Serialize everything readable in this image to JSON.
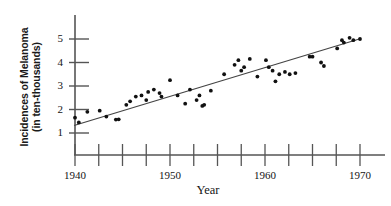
{
  "chart_data": {
    "type": "scatter",
    "title": "",
    "xlabel": "Year",
    "ylabel": "Incidences of Melanoma (in ten-thousands)",
    "ylabel_lines": [
      "Incidences of Melanoma",
      "(in ten-thousands)"
    ],
    "xlim": [
      1938.5,
      1971.5
    ],
    "ylim": [
      0.55,
      5.6
    ],
    "grid": false,
    "legend": null,
    "xtick_labels": [
      "1940",
      "1950",
      "1960",
      "1970"
    ],
    "xtick_values": [
      1940,
      1950,
      1960,
      1970
    ],
    "xminor_tick_values": [
      1940,
      1942.5,
      1945,
      1947.5,
      1950,
      1952.5,
      1955,
      1957.5,
      1960,
      1962.5,
      1965,
      1967.5,
      1970
    ],
    "ytick_labels": [
      "1",
      "2",
      "3",
      "4",
      "5"
    ],
    "ytick_values": [
      1,
      2,
      3,
      4,
      5
    ],
    "point_color": "#111111",
    "line_color": "#444444",
    "axis_color": "#555555",
    "background_color": "#ffffff",
    "series": [
      {
        "name": "Melanoma incidence",
        "x": [
          1940,
          1940.4,
          1941.3,
          1942.6,
          1943.3,
          1944.3,
          1944.6,
          1945.4,
          1945.8,
          1946.4,
          1947.0,
          1947.5,
          1947.7,
          1948.3,
          1948.9,
          1949.1,
          1950.0,
          1950.8,
          1951.6,
          1952.1,
          1952.8,
          1953.1,
          1953.4,
          1953.6,
          1954.3,
          1955.7,
          1956.8,
          1957.2,
          1957.5,
          1957.8,
          1958.4,
          1959.2,
          1960.1,
          1960.4,
          1960.8,
          1961.1,
          1961.5,
          1962.1,
          1962.6,
          1963.2,
          1964.7,
          1965.0,
          1965.9,
          1966.2,
          1967.6,
          1968.1,
          1968.3,
          1968.9,
          1969.3,
          1970.0
        ],
        "y": [
          1.65,
          1.45,
          1.9,
          1.95,
          1.7,
          1.57,
          1.58,
          2.2,
          2.35,
          2.55,
          2.6,
          2.4,
          2.75,
          2.85,
          2.7,
          2.55,
          3.25,
          2.6,
          2.25,
          2.85,
          2.4,
          2.6,
          2.15,
          2.2,
          2.8,
          3.5,
          3.9,
          4.1,
          3.65,
          3.8,
          4.15,
          3.4,
          4.1,
          3.8,
          3.65,
          3.2,
          3.5,
          3.6,
          3.5,
          3.55,
          4.25,
          4.25,
          4.0,
          3.85,
          4.6,
          4.95,
          4.85,
          5.05,
          4.95,
          5.0
        ]
      }
    ],
    "trend_line": {
      "type": "linear_fit",
      "x_start": 1939.9,
      "y_start": 1.32,
      "x_end": 1970.1,
      "y_end": 5.02
    }
  }
}
